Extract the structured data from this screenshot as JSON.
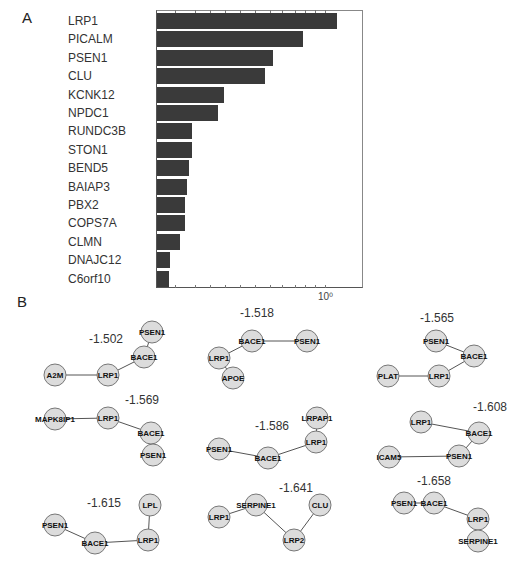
{
  "panels": {
    "a_label": "A",
    "b_label": "B"
  },
  "chart_data": [
    {
      "type": "bar",
      "orientation": "horizontal",
      "xscale": "log",
      "title": "",
      "xlabel": "",
      "ylabel": "",
      "categories": [
        "LRP1",
        "PICALM",
        "PSEN1",
        "CLU",
        "KCNK12",
        "NPDC1",
        "RUNDC3B",
        "STON1",
        "BEND5",
        "BAIAP3",
        "PBX2",
        "COPS7A",
        "CLMN",
        "DNAJC12",
        "C6orf10"
      ],
      "values": [
        1.12,
        0.78,
        0.55,
        0.5,
        0.31,
        0.29,
        0.21,
        0.21,
        0.2,
        0.195,
        0.19,
        0.19,
        0.18,
        0.16,
        0.158
      ],
      "bar_px_end": [
        337,
        303,
        273,
        265,
        224,
        218,
        192,
        192,
        189,
        187,
        185,
        185,
        180,
        170,
        169
      ],
      "x_tick_labels": [
        "10⁰"
      ],
      "x_tick_label_px": 325,
      "bar_color": "#3a3a3a",
      "grid": false,
      "legend": null
    },
    {
      "type": "network",
      "graphs": [
        {
          "score": "-1.502",
          "nodes": [
            "A2M",
            "LRP1",
            "BACE1",
            "PSEN1"
          ],
          "edges": [
            [
              "A2M",
              "LRP1"
            ],
            [
              "LRP1",
              "BACE1"
            ],
            [
              "BACE1",
              "PSEN1"
            ]
          ]
        },
        {
          "score": "-1.518",
          "nodes": [
            "BACE1",
            "PSEN1",
            "LRP1",
            "APOE"
          ],
          "edges": [
            [
              "BACE1",
              "PSEN1"
            ],
            [
              "BACE1",
              "LRP1"
            ],
            [
              "LRP1",
              "APOE"
            ]
          ]
        },
        {
          "score": "-1.565",
          "nodes": [
            "PSEN1",
            "BACE1",
            "LRP1",
            "PLAT"
          ],
          "edges": [
            [
              "PSEN1",
              "BACE1"
            ],
            [
              "BACE1",
              "LRP1"
            ],
            [
              "LRP1",
              "PLAT"
            ]
          ]
        },
        {
          "score": "-1.569",
          "nodes": [
            "MAPK8IP1",
            "LRP1",
            "BACE1",
            "PSEN1"
          ],
          "edges": [
            [
              "MAPK8IP1",
              "LRP1"
            ],
            [
              "LRP1",
              "BACE1"
            ],
            [
              "BACE1",
              "PSEN1"
            ]
          ]
        },
        {
          "score": "-1.586",
          "nodes": [
            "PSEN1",
            "BACE1",
            "LRP1",
            "LRPAP1"
          ],
          "edges": [
            [
              "PSEN1",
              "BACE1"
            ],
            [
              "BACE1",
              "LRP1"
            ],
            [
              "LRP1",
              "LRPAP1"
            ]
          ]
        },
        {
          "score": "-1.608",
          "nodes": [
            "LRP1",
            "BACE1",
            "PSEN1",
            "ICAM5"
          ],
          "edges": [
            [
              "LRP1",
              "BACE1"
            ],
            [
              "BACE1",
              "PSEN1"
            ],
            [
              "PSEN1",
              "ICAM5"
            ]
          ]
        },
        {
          "score": "-1.615",
          "nodes": [
            "PSEN1",
            "BACE1",
            "LRP1",
            "LPL"
          ],
          "edges": [
            [
              "PSEN1",
              "BACE1"
            ],
            [
              "BACE1",
              "LRP1"
            ],
            [
              "LRP1",
              "LPL"
            ]
          ]
        },
        {
          "score": "-1.641",
          "nodes": [
            "LRP1",
            "SERPINE1",
            "LRP2",
            "CLU"
          ],
          "edges": [
            [
              "LRP1",
              "SERPINE1"
            ],
            [
              "SERPINE1",
              "LRP2"
            ],
            [
              "LRP2",
              "CLU"
            ]
          ]
        },
        {
          "score": "-1.658",
          "nodes": [
            "PSEN1",
            "BACE1",
            "LRP1",
            "SERPINE1"
          ],
          "edges": [
            [
              "PSEN1",
              "BACE1"
            ],
            [
              "BACE1",
              "LRP1"
            ],
            [
              "LRP1",
              "SERPINE1"
            ]
          ]
        }
      ],
      "node_fill": "#dcdcdc",
      "node_stroke": "#777777"
    }
  ]
}
